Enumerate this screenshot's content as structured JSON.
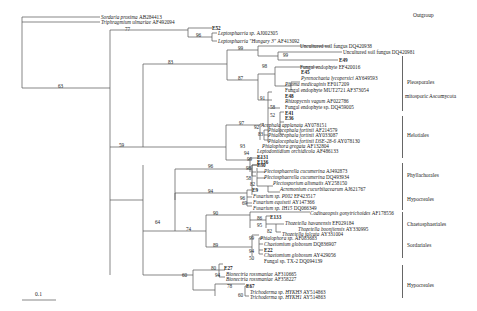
{
  "figure": {
    "type": "phylogenetic-tree",
    "scale_bar": "0.1"
  },
  "taxa": [
    {
      "name": "Sordaria proxima",
      "acc": "AB284413",
      "italic": true
    },
    {
      "name": "Triphragmium ulmariae",
      "acc": "AF492094",
      "italic": true
    },
    {
      "name": "E52",
      "acc": "",
      "italic": false,
      "bold": true
    },
    {
      "name": "Leptosphaeria sp.",
      "acc": "AJ002305",
      "italic": true
    },
    {
      "name": "Leptosphaeria \"Hungary 3\"",
      "acc": "AF413092",
      "italic": true
    },
    {
      "name": "Uncultured soil fungus",
      "acc": "DQ420938",
      "italic": false
    },
    {
      "name": "Uncultured soil fungus",
      "acc": "DQ420981",
      "italic": false
    },
    {
      "name": "E49",
      "acc": "",
      "italic": false,
      "bold": true
    },
    {
      "name": "Fungal endophyte",
      "acc": "EF420016",
      "italic": false
    },
    {
      "name": "E45",
      "acc": "",
      "italic": false,
      "bold": true
    },
    {
      "name": "Pyrenochaeta lycopersici",
      "acc": "AY649593",
      "italic": true
    },
    {
      "name": "Phoma medicaginis",
      "acc": "EF017209",
      "italic": true
    },
    {
      "name": "Fungal endophyte MUT2721",
      "acc": "AF373054",
      "italic": false
    },
    {
      "name": "E48",
      "acc": "",
      "italic": false,
      "bold": true
    },
    {
      "name": "Rhizopycnis vagum",
      "acc": "AF022786",
      "italic": true
    },
    {
      "name": "Fungal endophyte sp.",
      "acc": "DQ459005",
      "italic": false
    },
    {
      "name": "E41",
      "acc": "",
      "italic": false,
      "bold": true
    },
    {
      "name": "E36",
      "acc": "",
      "italic": false,
      "bold": true
    },
    {
      "name": "Acephala applanata",
      "acc": "AY078151",
      "italic": true
    },
    {
      "name": "Phialocephala fortinii",
      "acc": "AF214579",
      "italic": true
    },
    {
      "name": "Phialocephala fortinii",
      "acc": "AY033087",
      "italic": true
    },
    {
      "name": "Phialocephala fortinii DSE-28-6",
      "acc": "AY078130",
      "italic": true
    },
    {
      "name": "Phialophora gregata",
      "acc": "AF132804",
      "italic": true
    },
    {
      "name": "Leptodontidium orchidicola",
      "acc": "AF486133",
      "italic": true
    },
    {
      "name": "E131",
      "acc": "",
      "italic": false,
      "bold": true
    },
    {
      "name": "E136",
      "acc": "",
      "italic": false,
      "bold": true
    },
    {
      "name": "E30",
      "acc": "",
      "italic": false,
      "bold": true
    },
    {
      "name": "Plectosphaerella cucumerina",
      "acc": "AJ492873",
      "italic": true
    },
    {
      "name": "Plectosphaerella cucumerina",
      "acc": "DQ493934",
      "italic": true
    },
    {
      "name": "Plectosporium alismatis",
      "acc": "AY258150",
      "italic": true
    },
    {
      "name": "Acremonium cucurbitacearum",
      "acc": "AJ621767",
      "italic": true
    },
    {
      "name": "E9",
      "acc": "",
      "italic": false,
      "bold": true
    },
    {
      "name": "Fusarium sp. P002",
      "acc": "EF423517",
      "italic": true
    },
    {
      "name": "Fusarium equiseti",
      "acc": "AY147366",
      "italic": true
    },
    {
      "name": "Fusarium sp. IH15",
      "acc": "DQ066349",
      "italic": true
    },
    {
      "name": "Codinaeopsis gonytrichoides",
      "acc": "AF178556",
      "italic": true
    },
    {
      "name": "E133",
      "acc": "",
      "italic": false,
      "bold": true
    },
    {
      "name": "Thozetella havanensis",
      "acc": "EF029184",
      "italic": true
    },
    {
      "name": "Thozetella boonjiensis",
      "acc": "AY330995",
      "italic": true
    },
    {
      "name": "Thozetella falcata",
      "acc": "AY331004",
      "italic": true
    },
    {
      "name": "Phialophora sp.",
      "acc": "AF083683",
      "italic": true
    },
    {
      "name": "Chaetomium globosum",
      "acc": "DQ836907",
      "italic": true
    },
    {
      "name": "E22",
      "acc": "",
      "italic": false,
      "bold": true
    },
    {
      "name": "Chaetomium globosum",
      "acc": "AY429056",
      "italic": true
    },
    {
      "name": "Fungal sp. TX-2",
      "acc": "DQ094139",
      "italic": false
    },
    {
      "name": "E27",
      "acc": "",
      "italic": false,
      "bold": true
    },
    {
      "name": "Bionectria rossmaniae",
      "acc": "AF310665",
      "italic": true
    },
    {
      "name": "Bionectria rossmaniae",
      "acc": "AF358227",
      "italic": true
    },
    {
      "name": "E67",
      "acc": "",
      "italic": false,
      "bold": true
    },
    {
      "name": "Trichoderma sp. HYKH3",
      "acc": "AY514863",
      "italic": true
    },
    {
      "name": "Trichoderma sp. HYKH1",
      "acc": "AY514863",
      "italic": true
    }
  ],
  "bootstrap": [
    "77",
    "96",
    "63",
    "99",
    "87",
    "98",
    "99",
    "91",
    "58",
    "52",
    "83",
    "97",
    "92",
    "83",
    "59",
    "93",
    "94",
    "99",
    "96",
    "98",
    "58",
    "82",
    "94",
    "96",
    "69",
    "64",
    "74",
    "90",
    "86",
    "95",
    "82",
    "99",
    "89",
    "94",
    "50",
    "60",
    "80",
    "94",
    "78",
    "60"
  ],
  "groups": [
    {
      "label": "Outgroup"
    },
    {
      "label": "Pleosporales"
    },
    {
      "label": "mitosporic Ascomycota"
    },
    {
      "label": "Helotiales"
    },
    {
      "label": "Phyllachorales"
    },
    {
      "label": "Hypocreales"
    },
    {
      "label": "Chaetosphaeriales"
    },
    {
      "label": "Sordariales"
    },
    {
      "label": "Hypocreales"
    }
  ]
}
